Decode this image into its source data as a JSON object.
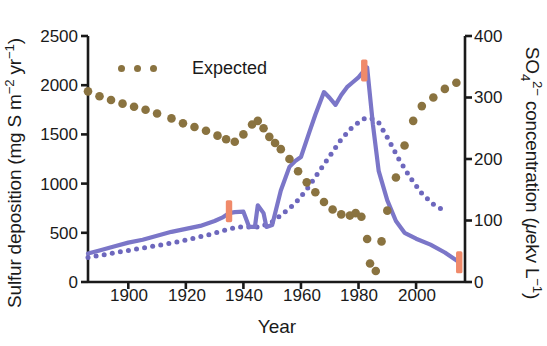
{
  "figure": {
    "xlabel": "Year",
    "legend": {
      "label": "Expected",
      "marker_color": "#8a7340",
      "position": "top-left-inside"
    }
  },
  "axes": {
    "left": {
      "title_parts": {
        "main": "Sulfur deposition (mg S m",
        "sup1": "−2",
        "mid": " yr",
        "sup2": "−1",
        "end": ")"
      },
      "ticks": [
        "0",
        "500",
        "1000",
        "1500",
        "2000",
        "2500"
      ],
      "range": [
        0,
        2500
      ],
      "units": "mg S m-2 yr-1"
    },
    "right": {
      "title_parts": {
        "so": "SO",
        "sub": "4",
        "charge": "2−",
        "main": " concentration (",
        "mu": "μ",
        "units": "ekv L",
        "sup": "−1",
        "end": ")"
      },
      "ticks": [
        "0",
        "100",
        "200",
        "300",
        "400"
      ],
      "range": [
        0,
        400
      ],
      "units": "uekv L-1"
    },
    "x": {
      "ticks": [
        "1900",
        "1920",
        "1940",
        "1960",
        "1980",
        "2000"
      ],
      "range": [
        1886,
        2017
      ]
    }
  },
  "colors": {
    "expected_dots": "#8a7340",
    "measured_line": "#7b76c8",
    "modelled_dotted": "#6d67bd",
    "highlight_marker": "#f08a6a",
    "axis": "#1a1a1a"
  },
  "chart_data": {
    "type": "line",
    "title": "",
    "xlabel": "Year",
    "ylabel": "Sulfur deposition (mg S m-2 yr-1)",
    "y2label": "SO4 2- concentration (uekv L-1)",
    "xlim": [
      1886,
      2017
    ],
    "ylim": [
      0,
      2500
    ],
    "y2lim": [
      0,
      400
    ],
    "grid": false,
    "legend": [
      "Expected"
    ],
    "series": [
      {
        "name": "Sulfur deposition (measured)",
        "style": "solid-line",
        "color": "#7b76c8",
        "axis": "left",
        "x": [
          1886,
          1890,
          1895,
          1900,
          1905,
          1910,
          1915,
          1920,
          1925,
          1930,
          1933,
          1935,
          1937,
          1940,
          1942,
          1944,
          1945,
          1947,
          1948,
          1950,
          1953,
          1956,
          1958,
          1960,
          1963,
          1965,
          1968,
          1970,
          1972,
          1974,
          1976,
          1978,
          1980,
          1982,
          1983,
          1985,
          1987,
          1990,
          1993,
          1996,
          2000,
          2005,
          2010,
          2015
        ],
        "y": [
          290,
          320,
          360,
          400,
          430,
          470,
          510,
          540,
          570,
          620,
          660,
          700,
          710,
          715,
          560,
          560,
          780,
          700,
          560,
          580,
          930,
          1170,
          1230,
          1270,
          1530,
          1700,
          1930,
          1870,
          1800,
          1900,
          1980,
          2030,
          2080,
          2150,
          2180,
          1600,
          1130,
          830,
          620,
          500,
          440,
          380,
          300,
          200
        ]
      },
      {
        "name": "Sulfur deposition (modelled)",
        "style": "dotted-line",
        "color": "#6d67bd",
        "axis": "left",
        "x": [
          1886,
          1892,
          1898,
          1904,
          1910,
          1916,
          1922,
          1928,
          1934,
          1938,
          1942,
          1946,
          1950,
          1954,
          1958,
          1962,
          1966,
          1970,
          1974,
          1978,
          1982,
          1984,
          1987,
          1990,
          1994,
          1998,
          2002,
          2006,
          2010
        ],
        "y": [
          250,
          280,
          310,
          340,
          370,
          400,
          440,
          480,
          530,
          560,
          560,
          560,
          610,
          700,
          800,
          940,
          1110,
          1280,
          1450,
          1580,
          1660,
          1670,
          1620,
          1470,
          1250,
          1060,
          900,
          790,
          720
        ]
      },
      {
        "name": "Expected",
        "style": "dots",
        "color": "#8a7340",
        "axis": "right",
        "x": [
          1886,
          1890,
          1894,
          1898,
          1902,
          1906,
          1910,
          1915,
          1919,
          1923,
          1927,
          1931,
          1934,
          1937,
          1940,
          1943,
          1945,
          1947,
          1949,
          1951,
          1953,
          1956,
          1959,
          1962,
          1965,
          1968,
          1971,
          1974,
          1977,
          1979,
          1981,
          1983,
          1984,
          1986,
          1988,
          1990,
          1993,
          1996,
          1999,
          2002,
          2006,
          2010,
          2014
        ],
        "y": [
          310,
          302,
          296,
          290,
          285,
          280,
          274,
          266,
          258,
          252,
          246,
          238,
          232,
          228,
          240,
          256,
          262,
          250,
          236,
          226,
          216,
          200,
          180,
          162,
          146,
          130,
          118,
          110,
          108,
          112,
          106,
          70,
          30,
          18,
          66,
          116,
          170,
          222,
          262,
          286,
          300,
          314,
          324
        ]
      }
    ],
    "highlight_markers": [
      {
        "x": 1935,
        "y": 720,
        "axis": "left",
        "color": "#f08a6a"
      },
      {
        "x": 1982,
        "y": 2150,
        "axis": "left",
        "color": "#f08a6a"
      },
      {
        "x": 2015,
        "y": 200,
        "axis": "left",
        "color": "#f08a6a"
      }
    ]
  }
}
